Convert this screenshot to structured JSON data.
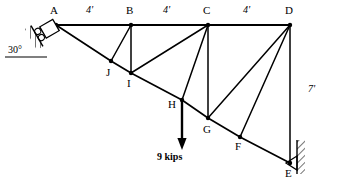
{
  "diagram": {
    "stroke_color": "#000000",
    "hatch_color": "#000000",
    "background": "#ffffff",
    "nodes": [
      {
        "id": "A",
        "label": "A",
        "x": 56,
        "y": 25,
        "label_x": 50,
        "label_y": 5
      },
      {
        "id": "B",
        "label": "B",
        "x": 131,
        "y": 25,
        "label_x": 126,
        "label_y": 5
      },
      {
        "id": "C",
        "label": "C",
        "x": 208,
        "y": 25,
        "label_x": 203,
        "label_y": 5
      },
      {
        "id": "D",
        "label": "D",
        "x": 290,
        "y": 25,
        "label_x": 285,
        "label_y": 5
      },
      {
        "id": "E",
        "label": "E",
        "x": 290,
        "y": 163,
        "label_x": 285,
        "label_y": 168
      },
      {
        "id": "F",
        "label": "F",
        "x": 240,
        "y": 137,
        "label_x": 235,
        "label_y": 141
      },
      {
        "id": "G",
        "label": "G",
        "x": 208,
        "y": 118,
        "label_x": 203,
        "label_y": 124
      },
      {
        "id": "H",
        "label": "H",
        "x": 182,
        "y": 100,
        "label_x": 168,
        "label_y": 99
      },
      {
        "id": "I",
        "label": "I",
        "x": 131,
        "y": 73,
        "label_x": 127,
        "label_y": 78
      },
      {
        "id": "J",
        "label": "J",
        "x": 111,
        "y": 61,
        "label_x": 106,
        "label_y": 67
      }
    ],
    "members": [
      {
        "from": "A",
        "to": "B",
        "kind": "top-chord"
      },
      {
        "from": "B",
        "to": "C",
        "kind": "top-chord"
      },
      {
        "from": "C",
        "to": "D",
        "kind": "top-chord"
      },
      {
        "from": "A",
        "to": "J",
        "kind": "bottom-chord"
      },
      {
        "from": "J",
        "to": "I",
        "kind": "bottom-chord"
      },
      {
        "from": "I",
        "to": "H",
        "kind": "bottom-chord"
      },
      {
        "from": "H",
        "to": "G",
        "kind": "bottom-chord"
      },
      {
        "from": "G",
        "to": "F",
        "kind": "bottom-chord"
      },
      {
        "from": "F",
        "to": "E",
        "kind": "bottom-chord"
      },
      {
        "from": "B",
        "to": "J",
        "kind": "diagonal"
      },
      {
        "from": "B",
        "to": "I",
        "kind": "vertical"
      },
      {
        "from": "C",
        "to": "I",
        "kind": "diagonal"
      },
      {
        "from": "C",
        "to": "H",
        "kind": "diagonal"
      },
      {
        "from": "C",
        "to": "G",
        "kind": "vertical"
      },
      {
        "from": "D",
        "to": "G",
        "kind": "diagonal"
      },
      {
        "from": "D",
        "to": "F",
        "kind": "diagonal"
      },
      {
        "from": "D",
        "to": "E",
        "kind": "vertical"
      }
    ],
    "dimensions": [
      {
        "id": "span-AB",
        "label": "4'",
        "label_x": 86,
        "label_y": 5
      },
      {
        "id": "span-BC",
        "label": "4'",
        "label_x": 163,
        "label_y": 5
      },
      {
        "id": "span-CD",
        "label": "4'",
        "label_x": 243,
        "label_y": 5
      },
      {
        "id": "height-DE",
        "label": "7'",
        "label_x": 308,
        "label_y": 84
      }
    ],
    "angle": {
      "id": "support-angle",
      "label": "30°",
      "label_x": 8,
      "label_y": 45,
      "value_degrees": 30
    },
    "load": {
      "id": "point-load-H",
      "label": "9 kips",
      "magnitude": 9,
      "unit": "kips",
      "direction": "down",
      "applied_at": "H",
      "arrow_x": 182,
      "arrow_y_start": 100,
      "arrow_y_end": 148,
      "label_x": 157,
      "label_y": 152
    },
    "supports": [
      {
        "id": "roller-support-A",
        "at": "A",
        "type": "inclined-roller",
        "angle_degrees": 30
      },
      {
        "id": "pin-support-E",
        "at": "E",
        "type": "wall-pin"
      }
    ]
  }
}
